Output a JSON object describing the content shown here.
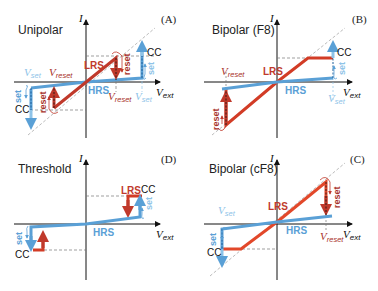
{
  "colors": {
    "lrs": "#c0392b",
    "lrs_bright": "#e2482a",
    "hrs": "#5aa0d6",
    "hrs_light": "#8ec3e8",
    "axis": "#111111",
    "guide": "#999999",
    "text": "#222222"
  },
  "panels": [
    {
      "id": "A",
      "title": "Unipolar",
      "tag": "(A)",
      "axis_y": "I",
      "axis_x": "V",
      "axis_x_sub": "ext",
      "lrs_label": "LRS",
      "hrs_label": "HRS",
      "cc_labels": [
        "CC",
        "CC"
      ],
      "v_set_label": "V",
      "v_set_sub": "set",
      "v_reset_label": "V",
      "v_reset_sub": "reset",
      "reset_label": "reset",
      "set_label": "set"
    },
    {
      "id": "B",
      "title": "Bipolar (F8)",
      "tag": "(B)",
      "axis_y": "I",
      "axis_x": "V",
      "axis_x_sub": "ext",
      "lrs_label": "LRS",
      "hrs_label": "HRS",
      "cc_labels": [
        "CC"
      ],
      "v_set_label": "V",
      "v_set_sub": "set",
      "v_reset_label": "V",
      "v_reset_sub": "reset",
      "reset_label": "reset",
      "set_label": "set"
    },
    {
      "id": "D",
      "title": "Threshold",
      "tag": "(D)",
      "axis_y": "I",
      "axis_x": "V",
      "axis_x_sub": "ext",
      "lrs_label": "LRS",
      "hrs_label": "HRS",
      "cc_labels": [
        "CC",
        "CC"
      ],
      "set_label": "set"
    },
    {
      "id": "C",
      "title": "Bipolar (cF8)",
      "tag": "(C)",
      "axis_y": "I",
      "axis_x": "V",
      "axis_x_sub": "ext",
      "lrs_label": "LRS",
      "hrs_label": "HRS",
      "cc_labels": [
        "CC"
      ],
      "v_set_label": "V",
      "v_set_sub": "set",
      "v_reset_label": "V",
      "v_reset_sub": "reset",
      "reset_label": "reset",
      "set_label": "set"
    }
  ]
}
